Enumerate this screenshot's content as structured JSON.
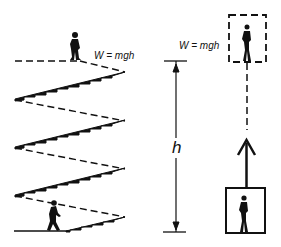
{
  "diagram": {
    "left_panel": {
      "equation": "W = mgh",
      "description": "person climbing a zig-zag staircase"
    },
    "right_panel": {
      "equation": "W = mgh",
      "height_label": "h",
      "description": "person lifted vertically by height h"
    },
    "colors": {
      "ink": "#111111",
      "background": "#ffffff"
    }
  }
}
